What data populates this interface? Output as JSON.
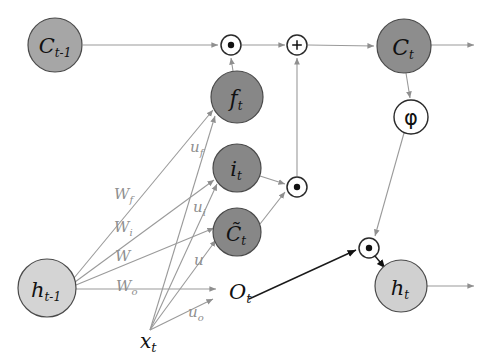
{
  "diagram": {
    "background_color": "#ffffff",
    "colors": {
      "node_dark": "#878787",
      "node_light": "#d4d4d4",
      "node_mid": "#9e9e9e",
      "stroke_dark": "#3a3a3a",
      "edge_gray": "#9a9a9a",
      "edge_dark": "#1a1a1a",
      "label_gray": "#8f8f8f",
      "label_dark": "#111111",
      "white": "#ffffff"
    },
    "nodes": [
      {
        "id": "c_prev",
        "label": "C",
        "sub": "t-1",
        "x": 55,
        "y": 45,
        "r": 27,
        "fill": "#a6a6a6",
        "kind": "state"
      },
      {
        "id": "f_gate",
        "label": "f",
        "sub": "t",
        "x": 237,
        "y": 97,
        "r": 26,
        "fill": "#878787",
        "kind": "gate"
      },
      {
        "id": "i_gate",
        "label": "i",
        "sub": "t",
        "x": 237,
        "y": 168,
        "r": 24,
        "fill": "#878787",
        "kind": "gate"
      },
      {
        "id": "c_tilde",
        "label": "C̃",
        "sub": "t",
        "x": 237,
        "y": 232,
        "r": 24,
        "fill": "#878787",
        "kind": "gate"
      },
      {
        "id": "c_next",
        "label": "C",
        "sub": "t",
        "x": 404,
        "y": 46,
        "r": 27,
        "fill": "#8d8d8d",
        "kind": "state"
      },
      {
        "id": "h_prev",
        "label": "h",
        "sub": "t-1",
        "x": 47,
        "y": 288,
        "r": 29,
        "fill": "#d4d4d4",
        "kind": "state"
      },
      {
        "id": "h_next",
        "label": "h",
        "sub": "t",
        "x": 401,
        "y": 286,
        "r": 26,
        "fill": "#d0d0d0",
        "kind": "state"
      }
    ],
    "operators": [
      {
        "id": "mul_forget",
        "symbol": "⊙",
        "glyph": "dot",
        "x": 231,
        "y": 45,
        "r": 10
      },
      {
        "id": "add_cell",
        "symbol": "⊕",
        "glyph": "plus",
        "x": 297,
        "y": 45,
        "r": 10
      },
      {
        "id": "mul_input",
        "symbol": "⊙",
        "glyph": "dot",
        "x": 297,
        "y": 187,
        "r": 10
      },
      {
        "id": "mul_output",
        "symbol": "⊙",
        "glyph": "dot",
        "x": 369,
        "y": 248,
        "r": 10
      },
      {
        "id": "phi_act",
        "symbol": "φ",
        "glyph": "phi",
        "x": 411,
        "y": 117,
        "r": 17
      }
    ],
    "text_labels": [
      {
        "id": "o_t",
        "label": "O",
        "sub": "t",
        "x": 229,
        "y": 292,
        "size": 20,
        "color": "#111111"
      },
      {
        "id": "x_t",
        "label": "x",
        "sub": "t",
        "x": 152,
        "y": 340,
        "size": 19,
        "color": "#111111"
      }
    ],
    "weights": [
      {
        "id": "w_f",
        "label": "W",
        "sub": "f",
        "x": 122,
        "y": 195,
        "target": "f_gate",
        "source": "h_prev"
      },
      {
        "id": "w_i",
        "label": "W",
        "sub": "i",
        "x": 122,
        "y": 229,
        "target": "i_gate",
        "source": "h_prev"
      },
      {
        "id": "w_c",
        "label": "W",
        "sub": "",
        "x": 123,
        "y": 258,
        "target": "c_tilde",
        "source": "h_prev"
      },
      {
        "id": "w_o",
        "label": "W",
        "sub": "o",
        "x": 124,
        "y": 288,
        "target": "o_t",
        "source": "h_prev"
      },
      {
        "id": "u_f",
        "label": "u",
        "sub": "f",
        "x": 196,
        "y": 148,
        "target": "f_gate",
        "source": "x_t"
      },
      {
        "id": "u_i",
        "label": "u",
        "sub": "i",
        "x": 199,
        "y": 208,
        "target": "i_gate",
        "source": "x_t"
      },
      {
        "id": "u_c",
        "label": "u",
        "sub": "",
        "x": 198,
        "y": 262,
        "target": "c_tilde",
        "source": "x_t"
      },
      {
        "id": "u_o",
        "label": "u",
        "sub": "o",
        "x": 194,
        "y": 313,
        "target": "o_t",
        "source": "x_t"
      }
    ],
    "edges": [
      {
        "id": "edge-cprev-mulforget",
        "from": "c_prev",
        "to": "mul_forget",
        "style": "gray"
      },
      {
        "id": "edge-fgate-mulforget",
        "from": "f_gate",
        "to": "mul_forget",
        "style": "gray"
      },
      {
        "id": "edge-mulforget-add",
        "from": "mul_forget",
        "to": "add_cell",
        "style": "gray"
      },
      {
        "id": "edge-mulinput-add",
        "from": "mul_input",
        "to": "add_cell",
        "style": "gray"
      },
      {
        "id": "edge-add-cnext",
        "from": "add_cell",
        "to": "c_next",
        "style": "gray"
      },
      {
        "id": "edge-igate-mulinput",
        "from": "i_gate",
        "to": "mul_input",
        "style": "gray"
      },
      {
        "id": "edge-ctilde-mulinput",
        "from": "c_tilde",
        "to": "mul_input",
        "style": "gray"
      },
      {
        "id": "edge-cnext-phi",
        "from": "c_next",
        "to": "phi_act",
        "style": "gray"
      },
      {
        "id": "edge-phi-muloutput",
        "from": "phi_act",
        "to": "mul_output",
        "style": "gray"
      },
      {
        "id": "edge-ot-muloutput",
        "from": "o_t",
        "to": "mul_output",
        "style": "dark"
      },
      {
        "id": "edge-muloutput-hnext",
        "from": "mul_output",
        "to": "h_next",
        "style": "dark"
      },
      {
        "id": "edge-cnext-out",
        "from": "c_next",
        "to": "right-edge",
        "style": "gray"
      },
      {
        "id": "edge-hnext-out",
        "from": "h_next",
        "to": "right-edge",
        "style": "gray"
      }
    ]
  }
}
